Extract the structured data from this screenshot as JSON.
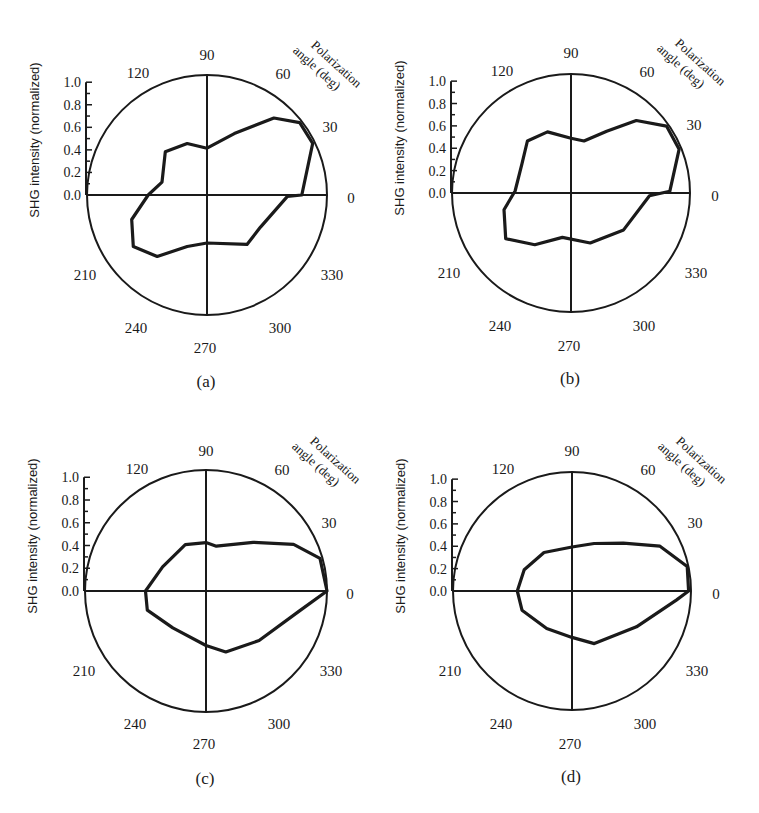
{
  "figure": {
    "panels": [
      "a",
      "b",
      "c",
      "d"
    ]
  },
  "chart_data": [
    {
      "type": "polar-line",
      "panel_caption": "(a)",
      "title": "",
      "ylabel": "SHG intensity (normalized)",
      "angle_axis_label": "Polarization angle (deg)",
      "radial_ticks": [
        "0.0",
        "0.2",
        "0.4",
        "0.6",
        "0.8",
        "1.0"
      ],
      "rlim": [
        0,
        1.0
      ],
      "angle_ticks": [
        "0",
        "30",
        "60",
        "90",
        "120",
        "210",
        "240",
        "270",
        "300",
        "330"
      ],
      "series": [
        {
          "name": "SHG intensity",
          "theta_deg": [
            0,
            26,
            38,
            49,
            66,
            90,
            111,
            134,
            164,
            180,
            198,
            215,
            231,
            249,
            270,
            309,
            329,
            359
          ],
          "r": [
            0.79,
            0.98,
            0.98,
            0.85,
            0.56,
            0.39,
            0.46,
            0.5,
            0.39,
            0.49,
            0.66,
            0.75,
            0.66,
            0.46,
            0.4,
            0.53,
            0.52,
            0.67
          ]
        }
      ]
    },
    {
      "type": "polar-line",
      "panel_caption": "(b)",
      "title": "",
      "ylabel": "SHG intensity (normalized)",
      "angle_axis_label": "Polarization angle (deg)",
      "radial_ticks": [
        "0.0",
        "0.2",
        "0.4",
        "0.6",
        "0.8",
        "1.0"
      ],
      "rlim": [
        0,
        1.0
      ],
      "angle_ticks": [
        "0",
        "30",
        "60",
        "90",
        "120",
        "210",
        "240",
        "270",
        "300",
        "330"
      ],
      "series": [
        {
          "name": "SHG intensity",
          "theta_deg": [
            1,
            22,
            35,
            48,
            60,
            76,
            90,
            111,
            130,
            149,
            178,
            194,
            215,
            235,
            259,
            291,
            325,
            358
          ],
          "r": [
            0.83,
            0.98,
            0.98,
            0.82,
            0.6,
            0.45,
            0.46,
            0.55,
            0.57,
            0.48,
            0.47,
            0.58,
            0.67,
            0.53,
            0.38,
            0.45,
            0.54,
            0.66
          ]
        }
      ]
    },
    {
      "type": "polar-line",
      "panel_caption": "(c)",
      "title": "",
      "ylabel": "SHG intensity (normalized)",
      "angle_axis_label": "Polarization angle (deg)",
      "radial_ticks": [
        "0.0",
        "0.2",
        "0.4",
        "0.6",
        "0.8",
        "1.0"
      ],
      "rlim": [
        0,
        1.0
      ],
      "angle_ticks": [
        "0",
        "30",
        "60",
        "90",
        "120",
        "210",
        "240",
        "270",
        "300",
        "330"
      ],
      "series": [
        {
          "name": "SHG intensity",
          "theta_deg": [
            0,
            16,
            28,
            46,
            77,
            90,
            114,
            151,
            180,
            198,
            228,
            270,
            288,
            317,
            348
          ],
          "r": [
            1.0,
            0.98,
            0.82,
            0.56,
            0.38,
            0.4,
            0.42,
            0.41,
            0.5,
            0.51,
            0.41,
            0.45,
            0.53,
            0.6,
            0.79
          ]
        }
      ]
    },
    {
      "type": "polar-line",
      "panel_caption": "(d)",
      "title": "",
      "ylabel": "SHG intensity (normalized)",
      "angle_axis_label": "Polarization angle (deg)",
      "radial_ticks": [
        "0.0",
        "0.2",
        "0.4",
        "0.6",
        "0.8",
        "1.0"
      ],
      "rlim": [
        0,
        1.0
      ],
      "angle_ticks": [
        "0",
        "30",
        "60",
        "90",
        "120",
        "210",
        "240",
        "270",
        "300",
        "330"
      ],
      "series": [
        {
          "name": "SHG intensity",
          "theta_deg": [
            0,
            12,
            27,
            43,
            65,
            90,
            126,
            156,
            180,
            201,
            236,
            270,
            293,
            331,
            355
          ],
          "r": [
            0.98,
            0.99,
            0.83,
            0.59,
            0.44,
            0.37,
            0.4,
            0.44,
            0.46,
            0.45,
            0.38,
            0.39,
            0.48,
            0.62,
            0.88
          ]
        }
      ]
    }
  ],
  "labels": {
    "ylabel": "SHG intensity (normalized)",
    "pol_line1": "Polarization",
    "pol_line2": "angle (deg)"
  }
}
